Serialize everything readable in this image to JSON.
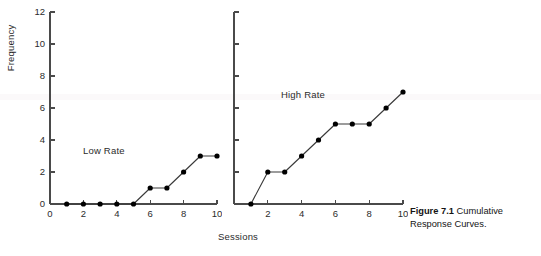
{
  "figure": {
    "caption_label": "Figure 7.1",
    "caption_text": "Cumulative Response Curves.",
    "axis_title_x": "Sessions",
    "axis_title_y": "Frequency"
  },
  "colors": {
    "ink": "#1a1a1a",
    "axis": "#4a4a4a",
    "marker": "#000000",
    "line": "#3a3a3a",
    "background": "#ffffff",
    "band": "#fbf9fa"
  },
  "chart_data": [
    {
      "type": "line",
      "name": "low-rate-panel",
      "title": "Low Rate",
      "xlabel": "Sessions",
      "ylabel": "Frequency",
      "x": [
        1,
        2,
        3,
        4,
        5,
        6,
        7,
        8,
        9,
        10
      ],
      "values": [
        0,
        0,
        0,
        0,
        0,
        1,
        1,
        2,
        3,
        3
      ],
      "xlim": [
        0,
        10
      ],
      "ylim": [
        0,
        12
      ],
      "xticks": [
        0,
        2,
        4,
        6,
        8,
        10
      ],
      "xtick_labels": [
        "0",
        "2",
        "4",
        "6",
        "8",
        "10"
      ],
      "yticks": [
        0,
        2,
        4,
        6,
        8,
        10,
        12
      ],
      "ytick_labels": [
        "0",
        "2",
        "4",
        "6",
        "8",
        "10",
        "12"
      ],
      "grid": false,
      "markers": "filled-circle"
    },
    {
      "type": "line",
      "name": "high-rate-panel",
      "title": "High Rate",
      "xlabel": "Sessions",
      "ylabel": "",
      "x": [
        1,
        2,
        3,
        4,
        5,
        6,
        7,
        8,
        9,
        10
      ],
      "values": [
        0,
        2,
        2,
        3,
        4,
        5,
        5,
        5,
        6,
        7
      ],
      "xlim": [
        0,
        10
      ],
      "ylim": [
        0,
        12
      ],
      "xticks": [
        2,
        4,
        6,
        8,
        10
      ],
      "xtick_labels": [
        "2",
        "4",
        "6",
        "8",
        "10"
      ],
      "yticks": [
        0,
        2,
        4,
        6,
        8,
        10,
        12
      ],
      "ytick_labels": [
        "",
        "",
        "",
        "",
        "",
        "",
        ""
      ],
      "grid": false,
      "markers": "filled-circle"
    }
  ]
}
